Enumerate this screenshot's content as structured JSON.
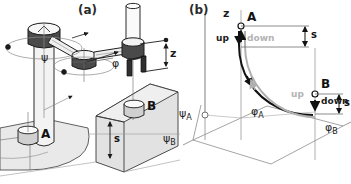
{
  "figure": {
    "background": "#ffffff",
    "stroke": "#2b2b2b",
    "fill_light": "#e8e8e8",
    "fill_mid": "#d2d2d2",
    "fill_dark": "#4a4a4a",
    "trajectory_dark": "#111111",
    "trajectory_light": "#b0b0b0"
  },
  "panel_a": {
    "tag": "(a)",
    "caption_role": "isometric view of SCARA manipulator",
    "joint_labels": {
      "base_rotation": "ψ",
      "elbow_rotation": "φ",
      "vertical_axis": "z"
    },
    "objects": [
      {
        "name": "A",
        "label": "A",
        "support": "conveyor"
      },
      {
        "name": "B",
        "label": "B",
        "support": "box"
      }
    ],
    "dimensions": [
      {
        "label": "z",
        "meaning": "vertical stroke of tool axis"
      },
      {
        "label": "s",
        "meaning": "approach/retract height above box"
      }
    ]
  },
  "panel_b": {
    "tag": "(b)",
    "caption_role": "configuration space trajectory between A and B",
    "axes": [
      {
        "label": "z",
        "name": "vertical-axis"
      },
      {
        "label": "ψ",
        "sub": "A",
        "name": "psi-a-axis"
      },
      {
        "label": "ψ",
        "sub": "B",
        "name": "psi-b-axis"
      },
      {
        "label": "φ",
        "sub": "A",
        "name": "phi-a-axis"
      },
      {
        "label": "φ",
        "sub": "B",
        "name": "phi-b-axis"
      }
    ],
    "points": [
      {
        "label": "A",
        "name": "point-a"
      },
      {
        "label": "B",
        "name": "point-b"
      }
    ],
    "motion_labels": [
      {
        "text": "up",
        "at": "A",
        "emphasis": "dark"
      },
      {
        "text": "down",
        "at": "A",
        "emphasis": "light"
      },
      {
        "text": "up",
        "at": "B",
        "emphasis": "light"
      },
      {
        "text": "down",
        "at": "B",
        "emphasis": "dark"
      }
    ],
    "dimensions": [
      {
        "label": "s",
        "at": "A",
        "meaning": "lift height at A"
      },
      {
        "label": "s",
        "at": "B",
        "meaning": "lift height at B"
      }
    ],
    "trajectories": [
      {
        "name": "outbound-path",
        "color": "#111111",
        "style": "solid-dark"
      },
      {
        "name": "return-path",
        "color": "#b0b0b0",
        "style": "solid-light"
      }
    ]
  }
}
